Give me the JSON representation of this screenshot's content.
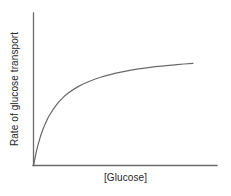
{
  "chart_data": {
    "type": "line",
    "title": "",
    "subtitle": "",
    "xlabel": "[Glucose]",
    "ylabel": "Rate of glucose transport",
    "x_tick_labels": [],
    "y_tick_labels": [],
    "grid": false,
    "legend": null,
    "legend_position": "none",
    "annotations": [],
    "axis_style": "open-L-spines",
    "xlim": [
      0,
      1
    ],
    "ylim": [
      0,
      1
    ],
    "curve_model": "v = Vmax * x / (Km + x)",
    "curve_params": {
      "Vmax": 1.0,
      "Km": 0.13
    },
    "series": [
      {
        "name": "Rate of glucose transport",
        "color": "#6a6a6a",
        "x": [
          0.0,
          0.02,
          0.04,
          0.06,
          0.08,
          0.1,
          0.14,
          0.18,
          0.22,
          0.28,
          0.34,
          0.42,
          0.5,
          0.58,
          0.66,
          0.74,
          0.82,
          0.9,
          1.0
        ],
        "y": [
          0.0,
          0.133,
          0.235,
          0.316,
          0.381,
          0.435,
          0.519,
          0.581,
          0.629,
          0.683,
          0.723,
          0.764,
          0.794,
          0.817,
          0.836,
          0.851,
          0.863,
          0.874,
          0.885
        ]
      }
    ]
  },
  "figure": {
    "background_color": "#ffffff",
    "line_color": "#6a6a6a",
    "axis_color": "#6b6b6b",
    "text_color": "#262626"
  }
}
